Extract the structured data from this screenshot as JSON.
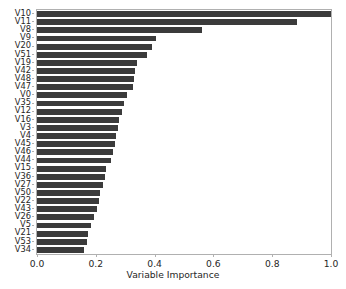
{
  "chart_data": {
    "type": "bar",
    "orientation": "horizontal",
    "title": "",
    "subtitle": "",
    "xlabel": "Variable Importance",
    "ylabel": "",
    "xlim": [
      0.0,
      1.0
    ],
    "xticks": [
      "0.0",
      "0.2",
      "0.4",
      "0.6",
      "0.8",
      "1.0"
    ],
    "xtick_values": [
      0.0,
      0.2,
      0.4,
      0.6,
      0.8,
      1.0
    ],
    "grid": false,
    "legend": null,
    "bar_color": "#3b3b3b",
    "background_color": "#ffffff",
    "axis_color": "#b0b0b0",
    "categories": [
      "V10",
      "V11",
      "V8",
      "V9",
      "V20",
      "V51",
      "V19",
      "V42",
      "V48",
      "V47",
      "V0",
      "V35",
      "V12",
      "V16",
      "V3",
      "V4",
      "V45",
      "V46",
      "V44",
      "V15",
      "V36",
      "V27",
      "V50",
      "V22",
      "V43",
      "V26",
      "V5",
      "V21",
      "V53",
      "V34"
    ],
    "values": [
      1.0,
      0.885,
      0.56,
      0.405,
      0.39,
      0.375,
      0.34,
      0.335,
      0.33,
      0.325,
      0.305,
      0.295,
      0.29,
      0.28,
      0.275,
      0.27,
      0.265,
      0.26,
      0.25,
      0.235,
      0.23,
      0.225,
      0.215,
      0.21,
      0.205,
      0.195,
      0.185,
      0.175,
      0.17,
      0.16
    ]
  }
}
